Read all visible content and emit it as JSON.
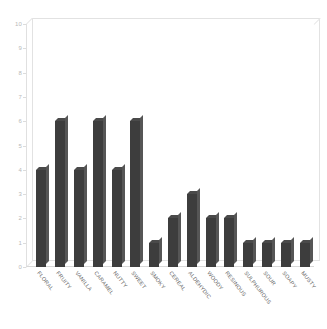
{
  "chart_data": {
    "type": "bar",
    "title": "",
    "subtitle": "",
    "xlabel": "",
    "ylabel": "",
    "ylim": [
      0,
      10
    ],
    "yticks": [
      0,
      1,
      2,
      3,
      4,
      5,
      6,
      7,
      8,
      9,
      10
    ],
    "grid": false,
    "legend": null,
    "bar_color": "#3d3d3d",
    "background_color": "#ffffff",
    "frame_color": "#e2e2e2",
    "tick_label_color": "#b9b9b9",
    "category_label_color": "#666666",
    "category_label_rotation_deg": 52,
    "categories": [
      "FLORAL",
      "FRUITY",
      "VANILLA",
      "CARAMEL",
      "NUTTY",
      "SWEET",
      "SMOKY",
      "CEREAL",
      "ALDEHYDIC",
      "WOODY",
      "RESINOUS",
      "SULPHUROUS",
      "SOUR",
      "SOAPY",
      "MUSTY"
    ],
    "values": [
      4,
      6,
      4,
      6,
      4,
      6,
      1,
      2,
      3,
      2,
      2,
      1,
      1,
      1,
      1
    ]
  }
}
